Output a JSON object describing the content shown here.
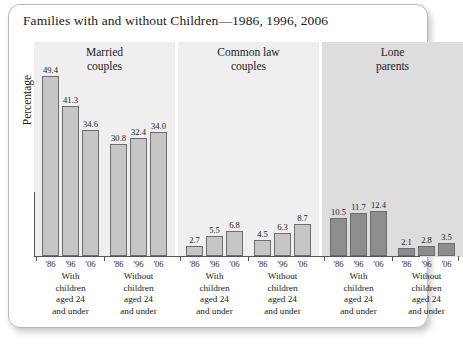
{
  "chart_data": {
    "type": "bar",
    "title": "Families with and without Children—1986, 1996, 2006",
    "xlabel": "",
    "ylabel": "Percentage",
    "ylim": [
      0,
      52
    ],
    "grid": false,
    "legend": "none",
    "years": [
      "'86",
      "'96",
      "'06"
    ],
    "group_headers": [
      {
        "line1": "Married",
        "line2": "couples",
        "shade": "light"
      },
      {
        "line1": "Common law",
        "line2": "couples",
        "shade": "light"
      },
      {
        "line1": "Lone",
        "line2": "parents",
        "shade": "dark"
      }
    ],
    "subgroup_caption_lines": {
      "with": [
        "With",
        "children",
        "aged 24",
        "and under"
      ],
      "without": [
        "Without",
        "children",
        "aged 24",
        "and under"
      ]
    },
    "subgroups": [
      {
        "group": "Married couples",
        "children": "With",
        "bar_shade": "light",
        "categories": [
          "'86",
          "'96",
          "'06"
        ],
        "values": [
          49.4,
          41.3,
          34.6
        ]
      },
      {
        "group": "Married couples",
        "children": "Without",
        "bar_shade": "light",
        "categories": [
          "'86",
          "'96",
          "'06"
        ],
        "values": [
          30.8,
          32.4,
          34.0
        ]
      },
      {
        "group": "Common law couples",
        "children": "With",
        "bar_shade": "light",
        "categories": [
          "'86",
          "'96",
          "'06"
        ],
        "values": [
          2.7,
          5.5,
          6.8
        ]
      },
      {
        "group": "Common law couples",
        "children": "Without",
        "bar_shade": "light",
        "categories": [
          "'86",
          "'96",
          "'06"
        ],
        "values": [
          4.5,
          6.3,
          8.7
        ]
      },
      {
        "group": "Lone parents",
        "children": "With",
        "bar_shade": "dark",
        "categories": [
          "'86",
          "'96",
          "'06"
        ],
        "values": [
          10.5,
          11.7,
          12.4
        ]
      },
      {
        "group": "Lone parents",
        "children": "Without",
        "bar_shade": "dark",
        "categories": [
          "'86",
          "'96",
          "'06"
        ],
        "values": [
          2.1,
          2.8,
          3.5
        ]
      }
    ],
    "colors": {
      "bar_light": "#c6c6c6",
      "bar_dark": "#8d8d8d",
      "bar_outline": "#6d6d6d",
      "panel_light": "#efefef",
      "panel_dark": "#dddddd",
      "axis": "#555555",
      "text": "#1c1c1c"
    }
  }
}
